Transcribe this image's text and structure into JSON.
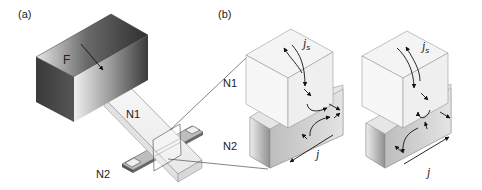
{
  "figure": {
    "panel_a": {
      "label": "(a)",
      "ferromagnet_label": "F",
      "normal_metal_1_label": "N1",
      "normal_metal_2_label": "N2"
    },
    "panel_b": {
      "label": "(b)",
      "n1_label": "N1",
      "n2_label": "N2",
      "spin_current_symbol": "j",
      "spin_current_subscript": "s",
      "charge_current_symbol": "j",
      "left_config": {
        "charge_current_direction": "toward-front-left"
      },
      "right_config": {
        "charge_current_direction": "toward-back-right"
      }
    },
    "colors": {
      "ferromagnet_dark": "#3a3a3a",
      "ferromagnet_light": "#e6e6e6",
      "n1_face": "#f2f2f2",
      "n2_face": "#cfcfcf",
      "lines": "#333333"
    }
  }
}
